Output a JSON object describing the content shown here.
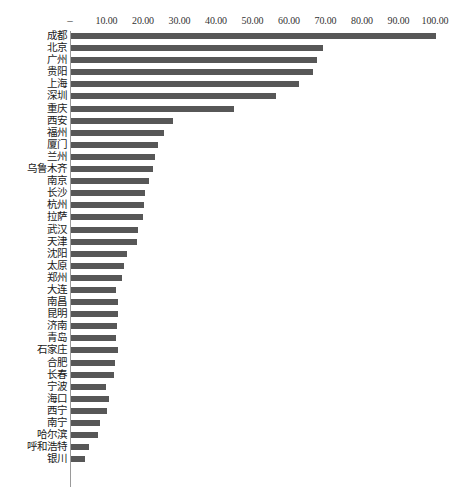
{
  "chart_data": {
    "type": "bar",
    "orientation": "horizontal",
    "title": "",
    "subtitle": "",
    "xlabel": "",
    "ylabel": "",
    "xlim": [
      0,
      100
    ],
    "grid": false,
    "legend": null,
    "axis_position": "top",
    "bar_color": "#575757",
    "background_color": "#ffffff",
    "axis_line_color": "#9a9a9a",
    "zero_tick_label": "–",
    "tick_labels": [
      "–",
      "10.00",
      "20.00",
      "30.00",
      "40.00",
      "50.00",
      "60.00",
      "70.00",
      "80.00",
      "90.00",
      "100.00"
    ],
    "tick_values": [
      0,
      10,
      20,
      30,
      40,
      50,
      60,
      70,
      80,
      90,
      100
    ],
    "categories": [
      "成都",
      "北京",
      "广州",
      "贵阳",
      "上海",
      "深圳",
      "重庆",
      "西安",
      "福州",
      "厦门",
      "兰州",
      "乌鲁木齐",
      "南京",
      "长沙",
      "杭州",
      "拉萨",
      "武汉",
      "天津",
      "沈阳",
      "太原",
      "郑州",
      "大连",
      "南昌",
      "昆明",
      "济南",
      "青岛",
      "石家庄",
      "合肥",
      "长春",
      "宁波",
      "海口",
      "西宁",
      "南宁",
      "哈尔滨",
      "呼和浩特",
      "银川"
    ],
    "values": [
      100.0,
      69.0,
      67.4,
      66.3,
      62.5,
      56.2,
      44.7,
      27.9,
      25.5,
      23.8,
      23.0,
      22.5,
      21.4,
      20.3,
      20.0,
      19.7,
      18.4,
      18.1,
      15.3,
      14.4,
      14.0,
      12.3,
      12.9,
      12.9,
      12.6,
      12.3,
      12.9,
      12.1,
      11.8,
      9.6,
      10.4,
      9.8,
      8.0,
      7.5,
      4.8,
      3.9
    ]
  }
}
